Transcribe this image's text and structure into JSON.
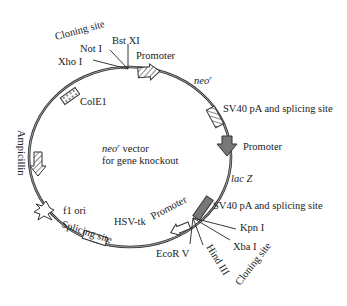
{
  "diagram": {
    "center_label_line1_italic": "neo",
    "center_label_line1_sup": "r",
    "center_label_line1_rest": " vector",
    "center_label_line2": "for gene knockout",
    "features": {
      "cloning_site_top": "Cloning site",
      "not1": "Not I",
      "bstx1": "Bst XI",
      "xho1": "Xho I",
      "promoter_top": "Promoter",
      "neo_r": "neo",
      "neo_r_sup": "r",
      "sv40_top": "SV40 pA and splicing site",
      "promoter_right": "Promoter",
      "lacz": "lac Z",
      "sv40_bottom": "SV40 pA and splicing site",
      "kpn1": "Kpn I",
      "xba1": "Xba I",
      "hind3": "Hind III",
      "cloning_site_bottom": "Cloning site",
      "ecorv": "EcoR V",
      "promoter_bottom": "Promoter",
      "hsv_tk": "HSV-tk",
      "splicing_site": "Splicing site",
      "f1_ori": "f1 ori",
      "ampicillin": "Ampicillin",
      "cole1": "ColE1"
    },
    "colors": {
      "backbone": "#333333",
      "dark_feature": "#777777",
      "light_feature": "#ffffff"
    }
  }
}
